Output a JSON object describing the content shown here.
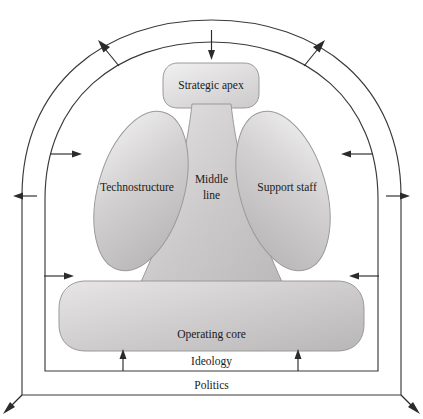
{
  "figure": {
    "type": "diagram"
  },
  "parts": {
    "strategic_apex": {
      "label": "Strategic apex"
    },
    "middle_line": {
      "label": "Middle\nline",
      "line1": "Middle",
      "line2": "line"
    },
    "technostructure": {
      "label": "Technostructure"
    },
    "support_staff": {
      "label": "Support staff"
    },
    "operating_core": {
      "label": "Operating core"
    }
  },
  "bands": {
    "ideology": {
      "label": "Ideology"
    },
    "politics": {
      "label": "Politics"
    }
  },
  "colors": {
    "outline": "#3a3a3a",
    "arrow": "#2b2b2b",
    "part_fill_light": "#eceaea",
    "part_fill_mid": "#c9c7c7",
    "part_fill_dark": "#b4b2b2",
    "part_stroke": "#9a9a9a",
    "background": "#ffffff",
    "text": "#1a1a1a"
  },
  "arrows": {
    "ideology_inward": [
      {
        "name": "ideology-arrow-top",
        "direction": "inward"
      },
      {
        "name": "ideology-arrow-left-upper",
        "direction": "inward"
      },
      {
        "name": "ideology-arrow-left-lower",
        "direction": "inward"
      },
      {
        "name": "ideology-arrow-right-upper",
        "direction": "inward"
      },
      {
        "name": "ideology-arrow-right-lower",
        "direction": "inward"
      },
      {
        "name": "ideology-arrow-bottom-left",
        "direction": "inward"
      },
      {
        "name": "ideology-arrow-bottom-right",
        "direction": "inward"
      }
    ],
    "politics_outward": [
      {
        "name": "politics-arrow-top-left",
        "direction": "outward"
      },
      {
        "name": "politics-arrow-top-right",
        "direction": "outward"
      },
      {
        "name": "politics-arrow-left",
        "direction": "outward"
      },
      {
        "name": "politics-arrow-right",
        "direction": "outward"
      },
      {
        "name": "politics-arrow-bottom-left",
        "direction": "outward"
      },
      {
        "name": "politics-arrow-bottom-right",
        "direction": "outward"
      }
    ]
  }
}
